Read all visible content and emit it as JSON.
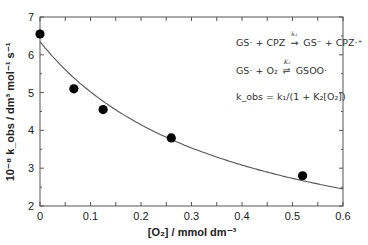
{
  "chart_data": {
    "type": "scatter",
    "title": "",
    "xlabel": "[O2] / mmol dm^-3",
    "ylabel": "10^-8 k_obs / dm^3 mol^-1 s^-1",
    "xlim": [
      0,
      0.6
    ],
    "ylim": [
      2,
      7
    ],
    "x_ticks": [
      0,
      0.1,
      0.2,
      0.3,
      0.4,
      0.5,
      0.6
    ],
    "y_ticks": [
      2,
      3,
      4,
      5,
      6,
      7
    ],
    "grid": false,
    "legend": null,
    "series": [
      {
        "name": "experimental",
        "style": "filled-circle",
        "x": [
          0.0,
          0.067,
          0.125,
          0.26,
          0.52
        ],
        "y": [
          6.55,
          5.1,
          4.55,
          3.8,
          2.8
        ]
      },
      {
        "name": "fit k_obs = k1/(1 + K2[O2])",
        "style": "line",
        "k1": 6.35,
        "K2": 2.65
      }
    ],
    "annotations": [
      "GS· + CPZ →(k1) GS⁻ + CPZ·⁺",
      "GS· + O2 ⇌(K2) GSOO·",
      "k_obs = k1/(1 + K2[O2])"
    ]
  },
  "labels": {
    "x_axis": "[O₂] / mmol dm⁻³",
    "y_axis": "10⁻⁸ k_obs / dm³ mol⁻¹ s⁻¹",
    "eq1_a": "GS· + CPZ",
    "eq1_k": "k₁",
    "eq1_b": "GS⁻ + CPZ·⁺",
    "eq2_a": "GS· + O₂",
    "eq2_k": "K₂",
    "eq2_b": "GSOO·",
    "eq3": "k_obs = k₁/(1 + K₂[O₂])"
  }
}
